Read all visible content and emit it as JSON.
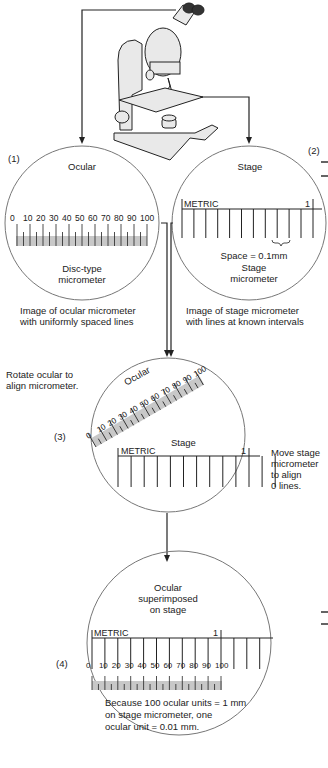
{
  "panels": {
    "p1": {
      "number": "(1)",
      "title": "Ocular",
      "scale_labels": [
        "0",
        "10",
        "20",
        "30",
        "40",
        "50",
        "60",
        "70",
        "80",
        "90",
        "100"
      ],
      "subtitle_line1": "Disc-type",
      "subtitle_line2": "micrometer",
      "caption_line1": "Image of ocular micrometer",
      "caption_line2": "with uniformly spaced lines"
    },
    "p2": {
      "number": "(2)",
      "title": "Stage",
      "metric_label": "METRIC",
      "end_mark": "1",
      "space_note": "Space = 0.1mm",
      "subtitle_line1": "Stage",
      "subtitle_line2": "micrometer",
      "caption_line1": "Image of stage micrometer",
      "caption_line2": "with lines at known intervals"
    },
    "p3": {
      "number": "(3)",
      "ocular_label": "Ocular",
      "scale_labels": [
        "0",
        "10",
        "20",
        "30",
        "40",
        "50",
        "60",
        "70",
        "80",
        "90",
        "100"
      ],
      "stage_label": "Stage",
      "metric_label": "METRIC",
      "end_mark": "1",
      "left_note_line1": "Rotate ocular to",
      "left_note_line2": "align micrometer.",
      "right_note_line1": "Move stage",
      "right_note_line2": "micrometer",
      "right_note_line3": "to align",
      "right_note_line4": "0 lines."
    },
    "p4": {
      "number": "(4)",
      "title_line1": "Ocular",
      "title_line2": "superimposed",
      "title_line3": "on stage",
      "metric_label": "METRIC",
      "end_mark": "1",
      "scale_labels": [
        "0",
        "10",
        "20",
        "30",
        "40",
        "50",
        "60",
        "70",
        "80",
        "90",
        "100"
      ],
      "note_line1": "Because 100 ocular units = 1 mm",
      "note_line2": "on stage micrometer, one",
      "note_line3": "ocular unit = 0.01 mm."
    }
  },
  "edge_mark": "1",
  "colors": {
    "line": "#222222",
    "circle": "#555555",
    "scale_fill": "#c8c8c8"
  }
}
